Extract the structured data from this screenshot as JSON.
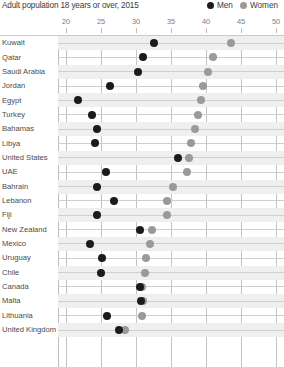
{
  "header": {
    "title": "Adult population 18 years or over, 2015",
    "legend": [
      {
        "label": "Men",
        "color": "#1b1b1b",
        "icon": "filled-circle-icon"
      },
      {
        "label": "Women",
        "color": "#9a9a9a",
        "icon": "filled-circle-icon"
      }
    ]
  },
  "chart_data": {
    "type": "scatter",
    "title": "Adult population 18 years or over, 2015",
    "subtitle": "",
    "xlabel": "",
    "ylabel": "",
    "xlim": [
      18.5,
      51.5
    ],
    "xticks": [
      20,
      25,
      30,
      35,
      40,
      45,
      50
    ],
    "grid": true,
    "legend_position": "top-right",
    "categories": [
      "Kuwait",
      "Qatar",
      "Saudi Arabia",
      "Jordan",
      "Egypt",
      "Turkey",
      "Bahamas",
      "Libya",
      "United States",
      "UAE",
      "Bahrain",
      "Lebanon",
      "Fiji",
      "New Zealand",
      "Mexico",
      "Uruguay",
      "Chile",
      "Canada",
      "Malta",
      "Lithuania",
      "United Kingdom"
    ],
    "series": [
      {
        "name": "Men",
        "color": "#1b1b1b",
        "values": [
          32.5,
          31.0,
          30.3,
          26.3,
          21.7,
          23.7,
          24.4,
          24.1,
          36.0,
          25.7,
          24.4,
          26.9,
          24.4,
          30.6,
          23.4,
          25.1,
          25.0,
          30.6,
          30.7,
          25.8,
          27.5
        ]
      },
      {
        "name": "Women",
        "color": "#9a9a9a",
        "values": [
          43.5,
          41.0,
          40.3,
          39.5,
          39.3,
          38.9,
          38.4,
          37.9,
          37.6,
          37.3,
          35.3,
          34.4,
          34.4,
          32.3,
          32.0,
          31.4,
          31.3,
          30.9,
          31.0,
          30.9,
          28.4
        ]
      }
    ]
  }
}
